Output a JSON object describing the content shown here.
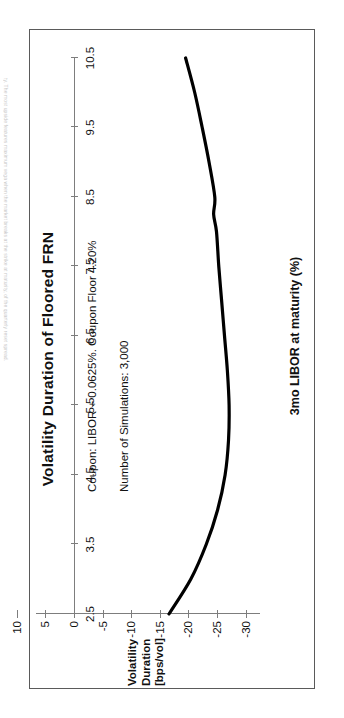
{
  "page": {
    "edge_caption": "ty. The most upside features maximum vega when the market breaks at the strike at maturity, of the quarterly reset spread."
  },
  "chart_data": {
    "type": "line",
    "title": "Volatility Duration of Floored FRN",
    "xlabel": "3mo LIBOR at maturity (%)",
    "ylabel_lines": [
      "Volatility",
      "Duration",
      "[bps/vol]"
    ],
    "xlim": [
      2.5,
      10.5
    ],
    "ylim": [
      -32.5,
      10
    ],
    "xticks": [
      2.5,
      3.5,
      4.5,
      5.5,
      6.5,
      7.5,
      8.5,
      9.5,
      10.5
    ],
    "xtick_labels": [
      "2.5",
      "3.5",
      "4.5",
      "5.5",
      "6.5",
      "7.5",
      "8.5",
      "9.5",
      "10.5"
    ],
    "yticks": [
      10,
      5,
      0,
      -5,
      -10,
      -15,
      -20,
      -25,
      -30
    ],
    "ytick_labels": [
      "10",
      "5",
      "0",
      "-5",
      "-10",
      "-15",
      "-20",
      "-25",
      "-30"
    ],
    "grid": false,
    "legend": null,
    "line_color": "#000000",
    "line_width": 3.2,
    "annotations": [
      "Coupon: LIBOR + 0.0625%. Coupon Floor 4.20%",
      "Number of Simulations: 3,000"
    ],
    "x": [
      2.5,
      3.0,
      3.5,
      4.0,
      4.5,
      5.0,
      5.5,
      6.0,
      6.5,
      7.0,
      7.5,
      8.0,
      8.25,
      8.5,
      9.0,
      9.5,
      10.0,
      10.5
    ],
    "y": [
      -16.6,
      -20.4,
      -23.1,
      -25.1,
      -26.4,
      -27.0,
      -27.1,
      -26.8,
      -26.3,
      -25.8,
      -25.3,
      -24.9,
      -24.4,
      -24.6,
      -23.6,
      -22.4,
      -21.1,
      -19.5
    ]
  }
}
